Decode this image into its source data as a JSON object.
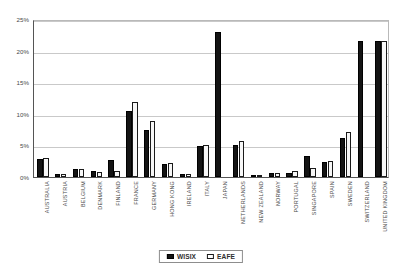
{
  "chart_data": {
    "type": "bar",
    "title": "",
    "xlabel": "",
    "ylabel": "",
    "ylim": [
      0,
      25
    ],
    "yticks": [
      0,
      5,
      10,
      15,
      20,
      25
    ],
    "ytick_labels": [
      "0%",
      "5%",
      "10%",
      "15%",
      "20%",
      "25%"
    ],
    "grid": true,
    "legend_position": "bottom-center",
    "categories": [
      "AUSTRALIA",
      "AUSTRIA",
      "BELGIUM",
      "DENMARK",
      "FINLAND",
      "FRANCE",
      "GERMANY",
      "HONG KONG",
      "IRELAND",
      "ITALY",
      "JAPAN",
      "NETHERLANDS",
      "NEW ZEALAND",
      "NORWAY",
      "PORTUGAL",
      "SINGAPORE",
      "SPAIN",
      "SWEDEN",
      "SWITZERLAND",
      "UNITED KINGDOM"
    ],
    "series": [
      {
        "name": "WISIX",
        "color": "#141414",
        "values": [
          2.9,
          0.4,
          1.2,
          1.0,
          2.7,
          10.5,
          7.5,
          2.1,
          0.5,
          4.9,
          23.0,
          5.0,
          0.2,
          0.7,
          0.6,
          3.4,
          2.4,
          6.2,
          21.6,
          21.6
        ]
      },
      {
        "name": "EAFE",
        "color": "#f7f7f7",
        "values": [
          3.0,
          0.4,
          1.3,
          0.8,
          1.0,
          11.8,
          8.8,
          2.2,
          0.4,
          5.1,
          0.0,
          5.7,
          0.3,
          0.6,
          0.9,
          1.4,
          2.5,
          7.2,
          0.0,
          21.6
        ]
      }
    ]
  },
  "legend": {
    "items": [
      {
        "label": "WISIX",
        "style": "filled"
      },
      {
        "label": "EAFE",
        "style": "outlined"
      }
    ]
  },
  "axis": {
    "y_tick_labels": [
      "25%",
      "20%",
      "15%",
      "10%",
      "5%",
      "0%"
    ]
  }
}
